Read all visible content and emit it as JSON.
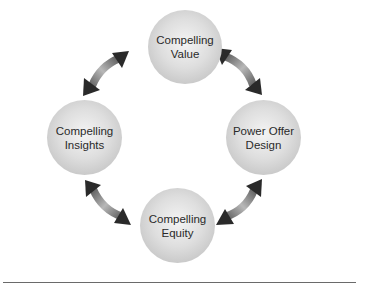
{
  "diagram": {
    "type": "cycle",
    "nodes": [
      {
        "id": "value",
        "line1": "Compelling",
        "line2": "Value"
      },
      {
        "id": "power-offer-design",
        "line1": "Power Offer",
        "line2": "Design"
      },
      {
        "id": "equity",
        "line1": "Compelling",
        "line2": "Equity"
      },
      {
        "id": "insights",
        "line1": "Compelling",
        "line2": "Insights"
      }
    ],
    "connections": [
      {
        "from": "value",
        "to": "power-offer-design",
        "style": "double-headed-curved-arrow"
      },
      {
        "from": "power-offer-design",
        "to": "equity",
        "style": "double-headed-curved-arrow"
      },
      {
        "from": "equity",
        "to": "insights",
        "style": "double-headed-curved-arrow"
      },
      {
        "from": "insights",
        "to": "value",
        "style": "double-headed-curved-arrow"
      }
    ],
    "colors": {
      "node_fill": "#d8d8d8",
      "arrow_dark": "#2a2a2a",
      "arrow_light": "#b0b0b0",
      "rule": "#6a6a6a"
    }
  }
}
